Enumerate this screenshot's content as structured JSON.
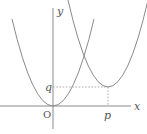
{
  "diagram": {
    "type": "coordinate-graph",
    "labels": {
      "x_axis": "x",
      "y_axis": "y",
      "origin": "O",
      "p": "p",
      "q": "q"
    },
    "curves": [
      {
        "name": "parabola-origin",
        "vertex": [
          "0",
          "0"
        ]
      },
      {
        "name": "parabola-translated",
        "vertex": [
          "p",
          "q"
        ]
      }
    ],
    "guides": [
      {
        "name": "dashed-horizontal",
        "from": "q on y-axis",
        "to": "vertex (p,q)"
      },
      {
        "name": "dashed-vertical",
        "from": "vertex (p,q)",
        "to": "p on x-axis"
      }
    ],
    "colors": {
      "line": "#8a8a8a",
      "text": "#555555",
      "background": "#ffffff"
    }
  }
}
